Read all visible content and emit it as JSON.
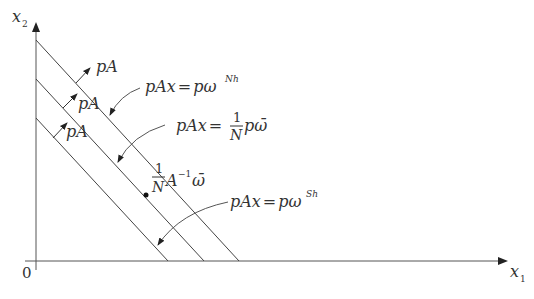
{
  "diagram": {
    "type": "budget-lines",
    "axes": {
      "x_label": "x",
      "x_sub": "1",
      "y_label": "x",
      "y_sub": "2",
      "origin_label": "0"
    },
    "normal_labels": [
      "pA",
      "pA",
      "pA"
    ],
    "lines": [
      {
        "name": "northern",
        "eq_lhs": "pAx",
        "eq_eq": "=",
        "eq_rhs": "pω",
        "sup": "Nh"
      },
      {
        "name": "average",
        "eq_lhs": "pAx",
        "eq_eq": "=",
        "frac_num": "1",
        "frac_den": "N",
        "eq_rhs": "pω̄"
      },
      {
        "name": "southern",
        "eq_lhs": "pAx",
        "eq_eq": "=",
        "eq_rhs": "pω",
        "sup": "Sh"
      }
    ],
    "point_label": {
      "frac_num": "1",
      "frac_den": "N",
      "body": "A",
      "sup": "−1",
      "tail": "ω̄"
    },
    "colors": {
      "line": "#444444",
      "text": "#333333",
      "background": "#ffffff"
    }
  }
}
